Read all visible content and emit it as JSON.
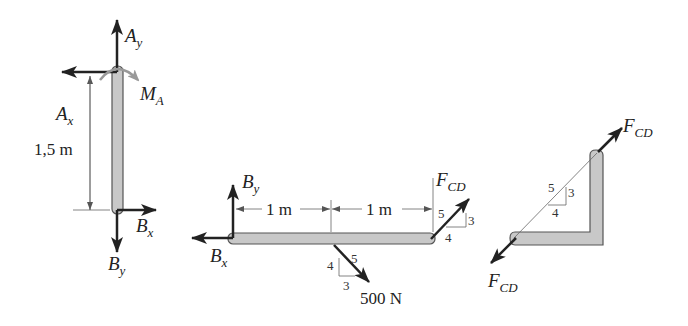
{
  "diagram": {
    "type": "free-body diagrams",
    "colors": {
      "member_fill": "#c8c8c8",
      "member_stroke": "#555555",
      "force": "#222222",
      "moment": "#999999",
      "dimension": "#666666"
    },
    "fbd_column": {
      "labels": {
        "Ay": {
          "main": "A",
          "sub": "y"
        },
        "Ax": {
          "main": "A",
          "sub": "x"
        },
        "MA": {
          "main": "M",
          "sub": "A"
        },
        "Bx": {
          "main": "B",
          "sub": "x"
        },
        "By": {
          "main": "B",
          "sub": "y"
        }
      },
      "dimension": "1,5 m"
    },
    "fbd_beam": {
      "labels": {
        "By": {
          "main": "B",
          "sub": "y"
        },
        "Bx": {
          "main": "B",
          "sub": "x"
        },
        "FCD": {
          "main": "F",
          "sub": "CD"
        }
      },
      "dim1": "1 m",
      "dim2": "1 m",
      "load": "500 N",
      "load_slope": {
        "a": "4",
        "b": "3",
        "c": "5"
      },
      "fcd_slope": {
        "a": "5",
        "b": "3",
        "c": "4"
      }
    },
    "fbd_link": {
      "labels": {
        "FCD_top": {
          "main": "F",
          "sub": "CD"
        },
        "FCD_bottom": {
          "main": "F",
          "sub": "CD"
        }
      },
      "slope": {
        "hyp": "5",
        "rise": "3",
        "run": "4"
      }
    }
  }
}
